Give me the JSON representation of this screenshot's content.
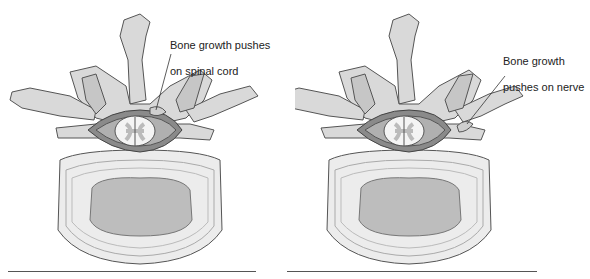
{
  "figure": {
    "panels": [
      {
        "id": "left",
        "label_line1": "Bone growth pushes",
        "label_line2": "on spinal cord",
        "subject": "spinal cord compression"
      },
      {
        "id": "right",
        "label_line1": "Bone growth",
        "label_line2": "pushes on nerve",
        "subject": "nerve root compression"
      }
    ],
    "colors": {
      "bone": "#d9d9d9",
      "bone_outline": "#555555",
      "disc_outer": "#ebebeb",
      "disc_inner": "#bdbdbd",
      "canal": "#8a8a8a",
      "cord": "#f4f4f4",
      "grey_matter": "#bbbbbb",
      "text": "#222222"
    }
  }
}
